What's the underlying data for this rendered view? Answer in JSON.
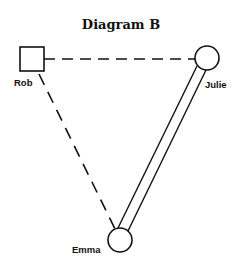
{
  "diagram": {
    "title": "Diagram B",
    "nodes": [
      {
        "id": "rob",
        "label": "Rob",
        "shape": "square"
      },
      {
        "id": "julie",
        "label": "Julie",
        "shape": "circle"
      },
      {
        "id": "emma",
        "label": "Emma",
        "shape": "circle"
      }
    ],
    "edges": [
      {
        "from": "rob",
        "to": "julie",
        "style": "dashed"
      },
      {
        "from": "rob",
        "to": "emma",
        "style": "dashed"
      },
      {
        "from": "julie",
        "to": "emma",
        "style": "double"
      }
    ]
  }
}
